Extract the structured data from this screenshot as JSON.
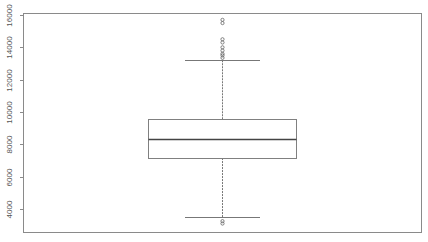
{
  "chart_data": {
    "type": "boxplot",
    "title": "",
    "xlabel": "",
    "ylabel": "",
    "ylim": [
      2700,
      16000
    ],
    "yticks": [
      4000,
      6000,
      8000,
      10000,
      12000,
      14000,
      16000
    ],
    "ytick_labels": [
      "4000",
      "6000",
      "8000",
      "10000",
      "12000",
      "14000",
      "16000"
    ],
    "grid": false,
    "legend": null,
    "box": {
      "lower_whisker": 3500,
      "q1": 7150,
      "median": 8300,
      "q3": 9550,
      "upper_whisker": 13200
    },
    "outliers": [
      15700,
      15500,
      14500,
      14300,
      14000,
      13800,
      13600,
      13500,
      13350,
      3250,
      3100
    ]
  },
  "colors": {
    "frame": "#8a8a8a",
    "box": "#808080",
    "median": "#444444",
    "whisker": "#777777",
    "tick_label": "#555555"
  }
}
